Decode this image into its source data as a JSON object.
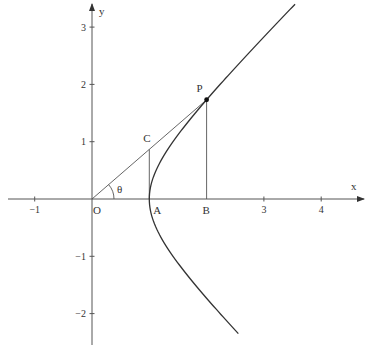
{
  "figure": {
    "type": "hyperbola-diagram",
    "equation": "x^2 - y^2 = 1",
    "axes": {
      "x_label": "x",
      "y_label": "y",
      "x_range": [
        -1.5,
        4.7
      ],
      "y_range": [
        -2.4,
        3.4
      ],
      "x_ticks": [
        {
          "value": -1,
          "label": "−1"
        },
        {
          "value": 3,
          "label": "3"
        },
        {
          "value": 4,
          "label": "4"
        }
      ],
      "y_ticks": [
        {
          "value": 3,
          "label": "3"
        },
        {
          "value": 2,
          "label": "2"
        },
        {
          "value": 1,
          "label": "1"
        },
        {
          "value": -1,
          "label": "−1"
        },
        {
          "value": -2,
          "label": "−2"
        }
      ]
    },
    "curve": {
      "y_min": -2.35,
      "y_max": 3.4
    },
    "points": {
      "O": {
        "label": "O",
        "x": 0,
        "y": 0
      },
      "A": {
        "label": "A",
        "x": 1,
        "y": 0
      },
      "B": {
        "label": "B",
        "x": 2,
        "y": 0
      },
      "P": {
        "label": "P",
        "x": 2,
        "y": 1.732
      },
      "C": {
        "label": "C",
        "x": 1,
        "y": 0.866
      }
    },
    "angle_label": "θ"
  }
}
